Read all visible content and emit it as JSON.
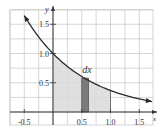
{
  "chart_data": {
    "type": "line",
    "title": "",
    "xlabel": "x",
    "ylabel": "y",
    "function": "y = e^(-x)",
    "xlim": [
      -0.7,
      1.75
    ],
    "ylim": [
      -0.2,
      1.75
    ],
    "grid": true,
    "grid_step": 0.25,
    "x_ticks": [
      {
        "value": -0.5,
        "label": "-0.5"
      },
      {
        "value": 0.5,
        "label": "0.5"
      },
      {
        "value": 1.0,
        "label": "1.0"
      },
      {
        "value": 1.5,
        "label": "1.5"
      }
    ],
    "y_ticks": [
      {
        "value": 0.5,
        "label": "0.5"
      },
      {
        "value": 1.0,
        "label": "1.0"
      },
      {
        "value": 1.5,
        "label": "1.5"
      }
    ],
    "curve_points": [
      {
        "x": -0.5,
        "y": 1.65
      },
      {
        "x": -0.25,
        "y": 1.28
      },
      {
        "x": 0.0,
        "y": 1.0
      },
      {
        "x": 0.25,
        "y": 0.78
      },
      {
        "x": 0.5,
        "y": 0.61
      },
      {
        "x": 0.75,
        "y": 0.47
      },
      {
        "x": 1.0,
        "y": 0.37
      },
      {
        "x": 1.25,
        "y": 0.29
      },
      {
        "x": 1.5,
        "y": 0.22
      },
      {
        "x": 1.72,
        "y": 0.18
      }
    ],
    "shaded_region": {
      "x_from": 0.0,
      "x_to": 1.0,
      "color": "#d9d9d9"
    },
    "strip": {
      "x_from": 0.5,
      "x_to": 0.62,
      "height": 0.58,
      "color": "#7a7a7a",
      "label": "dx"
    },
    "annotations": [
      {
        "text": "dx",
        "x": 0.56,
        "y": 0.66
      }
    ],
    "colors": {
      "curve": "#2a2a2a",
      "grid": "#bfbfbf",
      "axis": "#333333",
      "shade": "#d9d9d9",
      "strip": "#7a7a7a"
    }
  }
}
